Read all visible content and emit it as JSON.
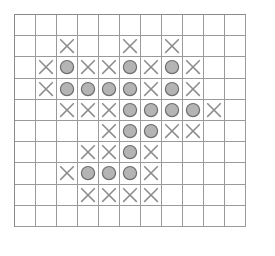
{
  "board": {
    "title": "cellular-grid",
    "columns": 11,
    "rows": 10,
    "cell_size_px": 21,
    "legend": {
      "x_symbol": "X",
      "o_symbol": "O",
      "empty_symbol": ""
    },
    "colors": {
      "background": "#ffffff",
      "grid_line": "#9a9a9a",
      "outer_border": "#8a8a8a",
      "x_mark": "#8c8c8c",
      "o_fill": "#b4b4b4",
      "o_stroke": "#6e6e6e"
    },
    "cells": [
      [
        "",
        "",
        "",
        "",
        "",
        "",
        "",
        "",
        "",
        "",
        ""
      ],
      [
        "",
        "",
        "X",
        "",
        "",
        "X",
        "",
        "X",
        "",
        "",
        ""
      ],
      [
        "",
        "X",
        "O",
        "X",
        "X",
        "O",
        "X",
        "O",
        "X",
        "",
        ""
      ],
      [
        "",
        "X",
        "O",
        "O",
        "O",
        "O",
        "X",
        "O",
        "X",
        "",
        ""
      ],
      [
        "",
        "",
        "X",
        "X",
        "X",
        "O",
        "O",
        "O",
        "O",
        "X",
        ""
      ],
      [
        "",
        "",
        "",
        "",
        "X",
        "O",
        "O",
        "X",
        "X",
        "",
        ""
      ],
      [
        "",
        "",
        "",
        "X",
        "X",
        "O",
        "X",
        "",
        "",
        "",
        ""
      ],
      [
        "",
        "",
        "X",
        "O",
        "O",
        "O",
        "X",
        "",
        "",
        "",
        ""
      ],
      [
        "",
        "",
        "",
        "X",
        "X",
        "X",
        "X",
        "",
        "",
        "",
        ""
      ],
      [
        "",
        "",
        "",
        "",
        "",
        "",
        "",
        "",
        "",
        "",
        ""
      ]
    ]
  }
}
